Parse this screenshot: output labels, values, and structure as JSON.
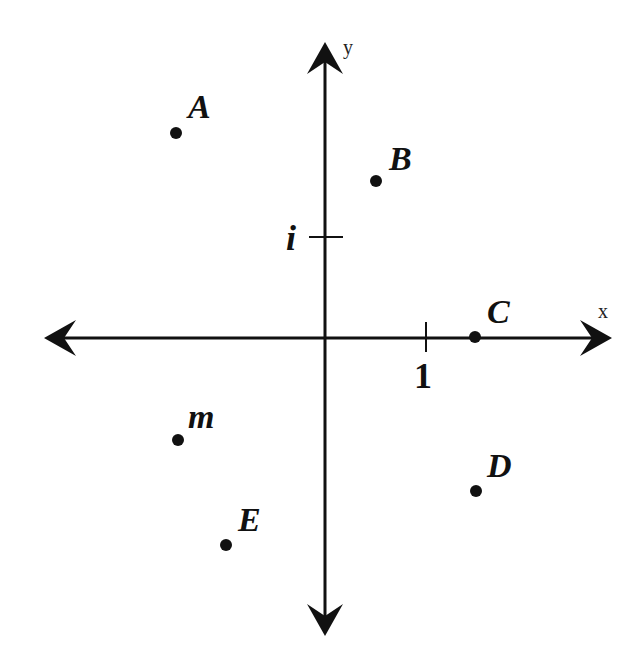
{
  "diagram": {
    "type": "complex-plane",
    "colors": {
      "ink": "#111111",
      "background": "#ffffff"
    },
    "axes": {
      "x": {
        "label": "x",
        "tick_label": "1"
      },
      "y": {
        "label": "y",
        "tick_label": "i"
      }
    },
    "points": [
      {
        "label": "A",
        "x": -1.5,
        "y": 2.0
      },
      {
        "label": "B",
        "x": 0.5,
        "y": 1.5
      },
      {
        "label": "C",
        "x": 1.5,
        "y": 0.0
      },
      {
        "label": "m",
        "x": -1.5,
        "y": -1.0
      },
      {
        "label": "D",
        "x": 1.5,
        "y": -1.5
      },
      {
        "label": "E",
        "x": -1.0,
        "y": -2.0
      }
    ]
  }
}
